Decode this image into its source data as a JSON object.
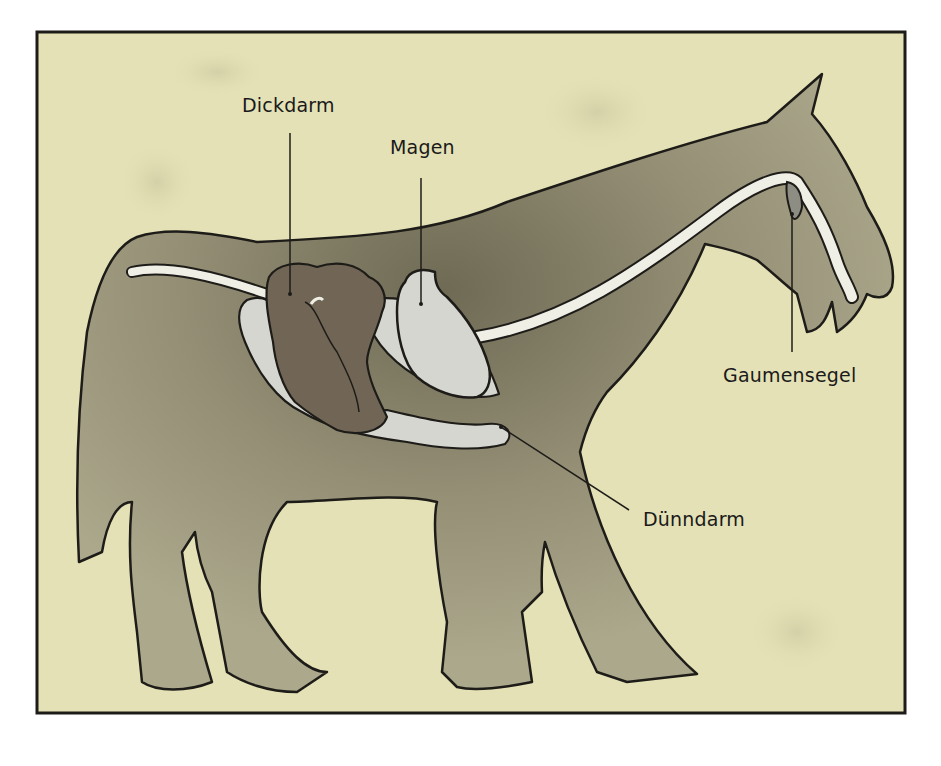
{
  "figure": {
    "colors": {
      "background": "#e4e1b6",
      "body": "#a29f84",
      "body_shadow": "#7a7660",
      "large_intestine": "#716655",
      "stomach_and_small_intestine": "#d6d6d0",
      "esophagus": "#f0efe6",
      "outline": "#1e1c18"
    }
  },
  "labels": {
    "dickdarm": "Dickdarm",
    "magen": "Magen",
    "duenndarm": "Dünndarm",
    "gaumensegel": "Gaumensegel"
  }
}
